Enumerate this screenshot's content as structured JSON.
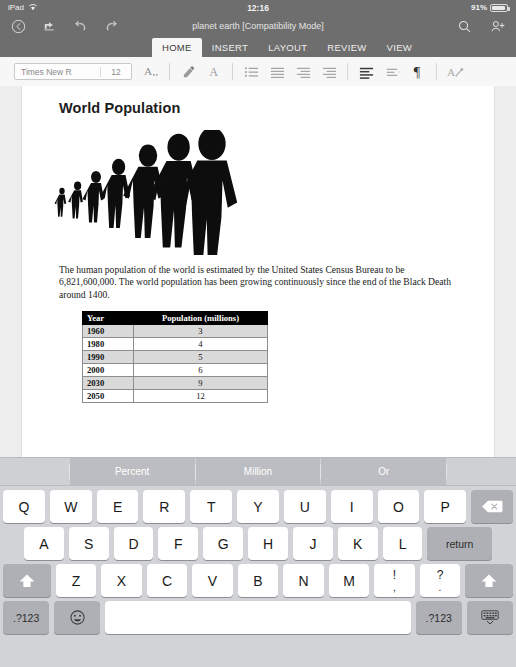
{
  "status_bar": {
    "device": "iPad",
    "wifi_icon": "wifi-icon",
    "time": "12:16",
    "battery_percent": "91%",
    "battery_icon": "battery-icon"
  },
  "command_bar": {
    "back_label": "back-icon",
    "history_label": "recents-icon",
    "undo_label": "undo-icon",
    "redo_label": "redo-icon",
    "document_title": "planet earth [Compatibility Mode]",
    "search_label": "search-icon",
    "share_label": "add-person-icon"
  },
  "ribbon": {
    "tabs": [
      {
        "label": "HOME",
        "active": true
      },
      {
        "label": "INSERT",
        "active": false
      },
      {
        "label": "LAYOUT",
        "active": false
      },
      {
        "label": "REVIEW",
        "active": false
      },
      {
        "label": "VIEW",
        "active": false
      }
    ]
  },
  "format_bar": {
    "font_name": "Times New R",
    "font_size": "12",
    "buttons": [
      {
        "name": "font-format-icon",
        "glyph": "A"
      },
      {
        "name": "highlight-icon",
        "glyph": "highlighter"
      },
      {
        "name": "font-color-icon",
        "glyph": "A"
      },
      {
        "name": "bullet-list-icon",
        "glyph": "bullets"
      },
      {
        "name": "numbered-list-icon",
        "glyph": "numbers"
      },
      {
        "name": "decrease-indent-icon",
        "glyph": "outdent"
      },
      {
        "name": "increase-indent-icon",
        "glyph": "indent"
      },
      {
        "name": "align-left-icon",
        "glyph": "align-left"
      },
      {
        "name": "line-spacing-icon",
        "glyph": "line-space"
      },
      {
        "name": "show-marks-icon",
        "glyph": "¶"
      },
      {
        "name": "clear-formatting-icon",
        "glyph": "A-pen"
      }
    ]
  },
  "document": {
    "heading": "World Population",
    "figure_alt": "population-silhouettes-image",
    "paragraph": "The human population of the world is estimated by the United States Census Bureau to be 6,821,600,000. The world population has been growing continuously since the end of the Black Death around 1400.",
    "table": {
      "headers": [
        "Year",
        "Population (millions)"
      ],
      "rows": [
        {
          "year": "1960",
          "population": "3"
        },
        {
          "year": "1980",
          "population": "4"
        },
        {
          "year": "1990",
          "population": "5"
        },
        {
          "year": "2000",
          "population": "6"
        },
        {
          "year": "2030",
          "population": "9"
        },
        {
          "year": "2050",
          "population": "12"
        }
      ]
    }
  },
  "keyboard": {
    "predictions": [
      "Percent",
      "Million",
      "Or"
    ],
    "row1": [
      "Q",
      "W",
      "E",
      "R",
      "T",
      "Y",
      "U",
      "I",
      "O",
      "P"
    ],
    "backspace_label": "backspace-icon",
    "row2": [
      "A",
      "S",
      "D",
      "F",
      "G",
      "H",
      "J",
      "K",
      "L"
    ],
    "return_label": "return",
    "row3": [
      "Z",
      "X",
      "C",
      "V",
      "B",
      "N",
      "M"
    ],
    "shift_left_label": "shift-icon",
    "shift_right_label": "shift-icon",
    "punct1_top": "!",
    "punct1_bottom": ",",
    "punct2_top": "?",
    "punct2_bottom": ".",
    "numeric_left_label": ".?123",
    "numeric_right_label": ".?123",
    "emoji_label": "emoji-icon",
    "space_label": "",
    "hide_keyboard_label": "hide-keyboard-icon"
  },
  "colors": {
    "chrome": "#6e6e6e",
    "toolbar": "#f7f7f7",
    "canvas": "#eeeeee",
    "keyboard": "#d2d3d7",
    "key": "#ffffff",
    "key_dark": "#aeb0b6",
    "table_header": "#000000",
    "table_shade": "#d9d9d9"
  }
}
